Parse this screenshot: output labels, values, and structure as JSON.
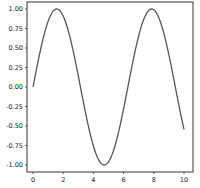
{
  "chart_data": {
    "type": "line",
    "title": "",
    "xlabel": "",
    "ylabel": "",
    "xlim": [
      -0.5,
      10.5
    ],
    "ylim": [
      -1.1,
      1.1
    ],
    "grid": false,
    "legend": null,
    "x_ticks": [
      "0",
      "2",
      "4",
      "6",
      "8",
      "10"
    ],
    "y_ticks": [
      "1.00",
      "0.75",
      "0.50",
      "0.25",
      "0.00",
      "-0.25",
      "-0.50",
      "-0.75",
      "-1.00"
    ],
    "series": [
      {
        "name": "sin(x)",
        "color": "#555555",
        "function": "sin(x)",
        "x": [
          0,
          0.5,
          1,
          1.5708,
          2,
          2.5,
          3,
          3.5,
          4,
          4.7124,
          5,
          5.5,
          6,
          6.5,
          7,
          7.854,
          8.5,
          9,
          9.5,
          10
        ],
        "y": [
          0,
          0.479,
          0.841,
          1.0,
          0.909,
          0.598,
          0.141,
          -0.351,
          -0.757,
          -1.0,
          -0.959,
          -0.706,
          -0.279,
          0.215,
          0.657,
          1.0,
          0.798,
          0.412,
          -0.075,
          -0.544
        ]
      }
    ]
  }
}
